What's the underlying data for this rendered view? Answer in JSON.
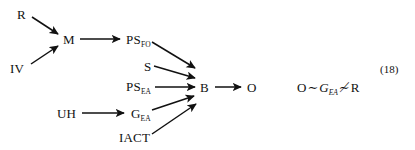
{
  "figure": {
    "equation_number": "(18)",
    "ink_color": "#111111",
    "background_color": "#ffffff"
  },
  "nodes": [
    {
      "id": "R",
      "label": "R",
      "sub": "",
      "x": 17,
      "y": 8
    },
    {
      "id": "IV",
      "label": "IV",
      "sub": "",
      "x": 10,
      "y": 62
    },
    {
      "id": "M",
      "label": "M",
      "sub": "",
      "x": 63,
      "y": 33
    },
    {
      "id": "PSFO",
      "label": "PS",
      "sub": "FO",
      "x": 126,
      "y": 33
    },
    {
      "id": "S",
      "label": "S",
      "sub": "",
      "x": 144,
      "y": 60
    },
    {
      "id": "PSEA",
      "label": "PS",
      "sub": "EA",
      "x": 126,
      "y": 80
    },
    {
      "id": "UH",
      "label": "UH",
      "sub": "",
      "x": 57,
      "y": 107
    },
    {
      "id": "GEA",
      "label": "G",
      "sub": "EA",
      "x": 131,
      "y": 107
    },
    {
      "id": "IACT",
      "label": "IACT",
      "sub": "",
      "x": 119,
      "y": 131
    },
    {
      "id": "B",
      "label": "B",
      "sub": "",
      "x": 200,
      "y": 81
    },
    {
      "id": "O",
      "label": "O",
      "sub": "",
      "x": 247,
      "y": 81
    }
  ],
  "edges": [
    {
      "from": "R",
      "to": "M",
      "x1": 32,
      "y1": 17,
      "x2": 58,
      "y2": 34
    },
    {
      "from": "IV",
      "to": "M",
      "x1": 31,
      "y1": 64,
      "x2": 58,
      "y2": 46
    },
    {
      "from": "M",
      "to": "PSFO",
      "x1": 80,
      "y1": 39,
      "x2": 120,
      "y2": 39
    },
    {
      "from": "PSFO",
      "to": "B",
      "x1": 152,
      "y1": 42,
      "x2": 195,
      "y2": 68
    },
    {
      "from": "S",
      "to": "B",
      "x1": 154,
      "y1": 66,
      "x2": 195,
      "y2": 78
    },
    {
      "from": "PSEA",
      "to": "B",
      "x1": 155,
      "y1": 87,
      "x2": 195,
      "y2": 87
    },
    {
      "from": "UH",
      "to": "GEA",
      "x1": 82,
      "y1": 113,
      "x2": 124,
      "y2": 113
    },
    {
      "from": "GEA",
      "to": "B",
      "x1": 152,
      "y1": 110,
      "x2": 194,
      "y2": 96
    },
    {
      "from": "IACT",
      "to": "B",
      "x1": 152,
      "y1": 134,
      "x2": 196,
      "y2": 104
    },
    {
      "from": "B",
      "to": "O",
      "x1": 215,
      "y1": 87,
      "x2": 241,
      "y2": 87
    }
  ],
  "relation": {
    "x": 297,
    "y": 81,
    "left": "O",
    "tilde": "∼",
    "middle_base": "G",
    "middle_sub": "EA",
    "not_tilde": "≠1",
    "not_tilde_glyph": "≁",
    "right": "R",
    "full_text": "O~G_EA ≁ R"
  },
  "equation_label": {
    "text": "(18)",
    "x": 380,
    "y": 64
  }
}
